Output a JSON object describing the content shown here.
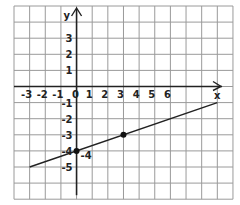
{
  "chart_data": {
    "type": "line",
    "title": "",
    "xlabel": "x",
    "ylabel": "y",
    "x_ticks": [
      -3,
      -2,
      -1,
      0,
      1,
      2,
      3,
      4,
      5,
      6
    ],
    "y_ticks": [
      3,
      2,
      1,
      -1,
      -2,
      -3,
      -4,
      -5
    ],
    "x_tick_labels": [
      "-3",
      "-2",
      "-1",
      "0",
      "1",
      "2",
      "3",
      "4",
      "5",
      "6"
    ],
    "y_tick_labels": [
      "3",
      "2",
      "1",
      "-1",
      "-2",
      "-3",
      "-4",
      "-5"
    ],
    "grid": true,
    "xlim": [
      -4,
      10
    ],
    "ylim": [
      -7,
      5
    ],
    "series": [
      {
        "name": "line",
        "equation": "y = x/3 - 4",
        "x": [
          -3,
          9
        ],
        "y": [
          -5,
          -1
        ]
      }
    ],
    "points": [
      {
        "x": 0,
        "y": -4,
        "label": "-4"
      },
      {
        "x": 3,
        "y": -3,
        "label": ""
      }
    ],
    "axis_label_x": "x",
    "axis_label_y": "y",
    "point_label": "-4"
  }
}
